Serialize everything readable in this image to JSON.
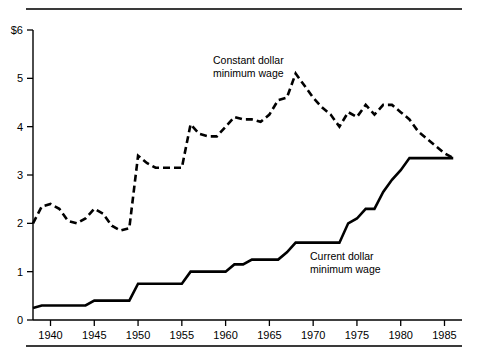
{
  "figure": {
    "background_color": "#ffffff",
    "line_color": "#000000",
    "rule_color": "#3a3a3a"
  },
  "annotations": {
    "constant": {
      "line1": "Constant dollar",
      "line2": "minimum wage"
    },
    "current": {
      "line1": "Current dollar",
      "line2": "minimum wage"
    }
  },
  "chart_data": {
    "type": "line",
    "title": "",
    "subtitle": "",
    "xlabel": "",
    "ylabel": "",
    "xlim": [
      1938,
      1987
    ],
    "ylim": [
      0,
      6
    ],
    "grid": false,
    "legend_position": "inline-annotation",
    "y_ticks": [
      0,
      1,
      2,
      3,
      4,
      5,
      6
    ],
    "y_tick_labels": [
      "0",
      "1",
      "2",
      "3",
      "4",
      "5",
      "$6"
    ],
    "x_ticks": [
      1940,
      1945,
      1950,
      1955,
      1960,
      1965,
      1970,
      1975,
      1980,
      1985
    ],
    "x_tick_labels": [
      "1940",
      "1945",
      "1950",
      "1955",
      "1960",
      "1965",
      "1970",
      "1975",
      "1980",
      "1985"
    ],
    "series": [
      {
        "name": "Constant dollar minimum wage",
        "style": "dashed",
        "x": [
          1938,
          1939,
          1940,
          1941,
          1942,
          1943,
          1944,
          1945,
          1946,
          1947,
          1948,
          1949,
          1950,
          1951,
          1952,
          1953,
          1954,
          1955,
          1956,
          1957,
          1958,
          1959,
          1960,
          1961,
          1962,
          1963,
          1964,
          1965,
          1966,
          1967,
          1968,
          1969,
          1970,
          1971,
          1972,
          1973,
          1974,
          1975,
          1976,
          1977,
          1978,
          1979,
          1980,
          1981,
          1982,
          1983,
          1984,
          1985,
          1986
        ],
        "y": [
          2.0,
          2.35,
          2.4,
          2.3,
          2.05,
          2.0,
          2.1,
          2.3,
          2.2,
          1.95,
          1.85,
          1.9,
          3.4,
          3.25,
          3.15,
          3.15,
          3.15,
          3.15,
          4.05,
          3.85,
          3.8,
          3.8,
          4.0,
          4.2,
          4.15,
          4.15,
          4.1,
          4.25,
          4.55,
          4.6,
          5.1,
          4.85,
          4.6,
          4.4,
          4.25,
          4.0,
          4.3,
          4.2,
          4.45,
          4.25,
          4.45,
          4.45,
          4.3,
          4.15,
          3.9,
          3.75,
          3.6,
          3.45,
          3.35
        ]
      },
      {
        "name": "Current dollar minimum wage",
        "style": "solid",
        "x": [
          1938,
          1939,
          1940,
          1941,
          1942,
          1943,
          1944,
          1945,
          1946,
          1947,
          1948,
          1949,
          1950,
          1951,
          1952,
          1953,
          1954,
          1955,
          1956,
          1957,
          1958,
          1959,
          1960,
          1961,
          1962,
          1963,
          1964,
          1965,
          1966,
          1967,
          1968,
          1969,
          1970,
          1971,
          1972,
          1973,
          1974,
          1975,
          1976,
          1977,
          1978,
          1979,
          1980,
          1981,
          1982,
          1983,
          1984,
          1985,
          1986
        ],
        "y": [
          0.25,
          0.3,
          0.3,
          0.3,
          0.3,
          0.3,
          0.3,
          0.4,
          0.4,
          0.4,
          0.4,
          0.4,
          0.75,
          0.75,
          0.75,
          0.75,
          0.75,
          0.75,
          1.0,
          1.0,
          1.0,
          1.0,
          1.0,
          1.15,
          1.15,
          1.25,
          1.25,
          1.25,
          1.25,
          1.4,
          1.6,
          1.6,
          1.6,
          1.6,
          1.6,
          1.6,
          2.0,
          2.1,
          2.3,
          2.3,
          2.65,
          2.9,
          3.1,
          3.35,
          3.35,
          3.35,
          3.35,
          3.35,
          3.35
        ]
      }
    ]
  }
}
